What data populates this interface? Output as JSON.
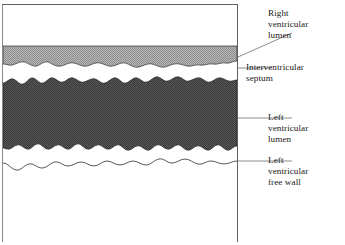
{
  "figure": {
    "type": "m-mode-echocardiogram-tracing",
    "panel": {
      "border_color": "#5d5d5d",
      "background": "#ffffff",
      "x": 2,
      "y": 4,
      "width": 236,
      "height": 238
    }
  },
  "labels": [
    {
      "id": "right-ventricular-lumen",
      "lines": [
        "Right",
        "ventricular",
        "lumen"
      ],
      "leader": {
        "style": "diagonal",
        "from_x": 238,
        "from_y": 57,
        "to_x": 292,
        "to_y": 33
      }
    },
    {
      "id": "interventricular-septum",
      "lines": [
        "Interventricular",
        "septum"
      ],
      "leader": {
        "style": "horizontal",
        "from_x": 238,
        "from_y": 68,
        "to_x": 272,
        "to_y": 68
      }
    },
    {
      "id": "left-ventricular-lumen",
      "lines": [
        "Left",
        "ventricular",
        "lumen"
      ],
      "leader": {
        "style": "horizontal",
        "from_x": 238,
        "from_y": 118,
        "to_x": 292,
        "to_y": 118
      }
    },
    {
      "id": "left-ventricular-free-wall",
      "lines": [
        "Left",
        "ventricular",
        "free wall"
      ],
      "leader": {
        "style": "horizontal",
        "from_x": 238,
        "from_y": 161,
        "to_x": 292,
        "to_y": 161
      }
    }
  ],
  "bands": [
    {
      "id": "right-ventricular-lumen-band",
      "name": "Right ventricular lumen",
      "fill": "#ffffff",
      "top": 5,
      "bottom": 46,
      "note": "clear anechoic space above the septum"
    },
    {
      "id": "interventricular-septum-band",
      "name": "Interventricular septum",
      "fill": "#a3a3a3",
      "top": 46,
      "bottom": 64,
      "note": "light stippled band, flat top edge, wavy lower border"
    },
    {
      "id": "left-ventricular-lumen-band",
      "name": "Left ventricular lumen",
      "fill": "#4a4a4a",
      "top": 80,
      "bottom": 150,
      "note": "dark stippled band with jagged upper and lower borders"
    },
    {
      "id": "left-ventricular-free-wall-band",
      "name": "Left ventricular free wall",
      "fill": "#ffffff",
      "top": 150,
      "bottom": 178,
      "note": "white zone bounded below by a thin wavy endocardial outline"
    }
  ],
  "colors": {
    "septum_gray": "#a3a3a3",
    "lumen_dark": "#4a4a4a",
    "outline": "#2b2b2b",
    "frame": "#5d5d5d",
    "leader": "#6f6f6f",
    "text": "#1a1a1a"
  }
}
